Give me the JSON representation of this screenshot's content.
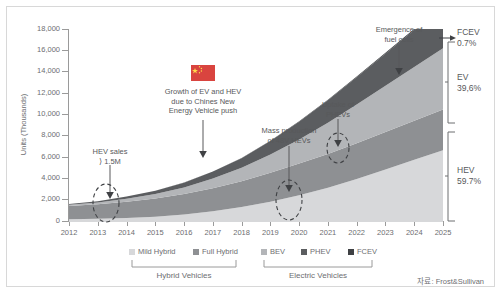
{
  "chart_data": {
    "type": "area",
    "title": "",
    "xlabel": "",
    "ylabel": "Units (Thousands)",
    "ylim": [
      0,
      18000
    ],
    "y_ticks": [
      "0",
      "2,000",
      "4,000",
      "6,000",
      "8,000",
      "10,000",
      "12,000",
      "14,000",
      "16,000",
      "18,000"
    ],
    "y_tick_values": [
      0,
      2000,
      4000,
      6000,
      8000,
      10000,
      12000,
      14000,
      16000,
      18000
    ],
    "grid": false,
    "legend_position": "bottom",
    "stacked": true,
    "categories": [
      "2012",
      "2013",
      "2014",
      "2015",
      "2016",
      "2017",
      "2018",
      "2019",
      "2020",
      "2021",
      "2022",
      "2023",
      "2024",
      "2025"
    ],
    "series": [
      {
        "name": "Mild Hybrid",
        "color": "#d7d8da",
        "values": [
          250,
          300,
          380,
          500,
          700,
          1000,
          1400,
          1900,
          2500,
          3200,
          4000,
          4900,
          5800,
          6700
        ]
      },
      {
        "name": "Full Hybrid",
        "color": "#8e9093",
        "values": [
          1250,
          1350,
          1520,
          1700,
          1900,
          2150,
          2400,
          2700,
          2950,
          3150,
          3350,
          3500,
          3650,
          3800
        ]
      },
      {
        "name": "BEV",
        "color": "#b3b5b8",
        "values": [
          120,
          180,
          280,
          420,
          620,
          900,
          1250,
          1700,
          2250,
          2900,
          3600,
          4300,
          5000,
          5700
        ]
      },
      {
        "name": "PHEV",
        "color": "#5b5d60",
        "values": [
          60,
          110,
          190,
          300,
          450,
          650,
          900,
          1250,
          1650,
          2100,
          2550,
          3000,
          3450,
          3900
        ]
      },
      {
        "name": "FCEV",
        "color": "#3f4144",
        "values": [
          0,
          0,
          0,
          2,
          5,
          10,
          18,
          30,
          45,
          60,
          78,
          95,
          110,
          126
        ]
      }
    ],
    "share_labels": [
      {
        "name": "FCEV",
        "value": "0.7%"
      },
      {
        "name": "EV",
        "value": "39,6%"
      },
      {
        "name": "HEV",
        "value": "59.7%"
      }
    ],
    "annotations": [
      {
        "id": "hev-sales",
        "text": "HEV sales\n⟩ 1.5M"
      },
      {
        "id": "china-growth",
        "text": "Growth of EV and HEV\ndue to Chines New\nEnergy Vehicle push",
        "icon": "china-flag-icon"
      },
      {
        "id": "mass-production",
        "text": "Mass production\nof 48V HEVs"
      },
      {
        "id": "uptake-phev",
        "text": "Uptake of\nPHEVs"
      },
      {
        "id": "fuel-cells",
        "text": "Emergence of\nfuel cells"
      }
    ],
    "legend_groups": [
      {
        "label": "Hybrid Vehicles",
        "items": [
          "Mild Hybrid",
          "Full Hybrid"
        ]
      },
      {
        "label": "Electric Vehicles",
        "items": [
          "BEV",
          "PHEV",
          "FCEV"
        ]
      }
    ],
    "source": "자료: Frost&Sullivan"
  },
  "axis": {
    "y_title": "Units (Thousands)",
    "y_labels": [
      "18,000",
      "16,000",
      "14,000",
      "12,000",
      "10,000",
      "8,000",
      "6,000",
      "4,000",
      "2,000",
      "0"
    ],
    "x_labels": [
      "2012",
      "2013",
      "2014",
      "2015",
      "2016",
      "2017",
      "2018",
      "2019",
      "2020",
      "2021",
      "2022",
      "2023",
      "2024",
      "2025"
    ]
  },
  "annotations": {
    "hev_sales_line1": "HEV sales",
    "hev_sales_line2": "⟩ 1.5M",
    "china_line1": "Growth of EV and HEV",
    "china_line2": "due to Chines New",
    "china_line3": "Energy Vehicle push",
    "mass_line1": "Mass production",
    "mass_line2": "of 48V HEVs",
    "uptake_line1": "Uptake of",
    "uptake_line2": "PHEVs",
    "fuelcells_line1": "Emergence of",
    "fuelcells_line2": "fuel cells"
  },
  "brackets": {
    "fcev_name": "FCEV",
    "fcev_value": "0.7%",
    "ev_name": "EV",
    "ev_value": "39,6%",
    "hev_name": "HEV",
    "hev_value": "59.7%"
  },
  "legend": {
    "mild_hybrid": "Mild Hybrid",
    "full_hybrid": "Full Hybrid",
    "bev": "BEV",
    "phev": "PHEV",
    "fcev": "FCEV",
    "hybrid_group": "Hybrid Vehicles",
    "electric_group": "Electric Vehicles"
  },
  "source": "자료: Frost&Sullivan",
  "colors": {
    "mild_hybrid": "#d7d8da",
    "full_hybrid": "#8e9093",
    "bev": "#b3b5b8",
    "phev": "#5b5d60",
    "fcev": "#3f4144",
    "axis": "#9a9a9a",
    "text": "#6d6e71"
  }
}
